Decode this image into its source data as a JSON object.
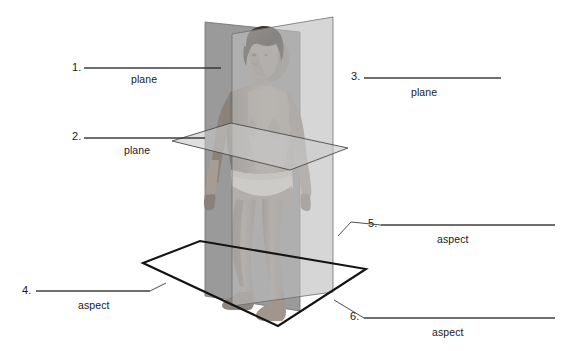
{
  "figure": {
    "background_color": "#ffffff",
    "ink_color": "#1a1a1a"
  },
  "colors": {
    "coronal_plane_fill": "#9a9a9a",
    "sagittal_plane_fill": "#bdbdbd",
    "transverse_plane_fill": "#c9c9c9",
    "base_plane_fill": "#ffffff",
    "base_outline": "#151515",
    "plane_outline": "#6a6a6a",
    "leader_line": "#3a3a3a",
    "figure_skin": "#a79e97",
    "figure_skin_shadow": "#8a8078",
    "figure_hair": "#3b342f",
    "figure_garment": "#ece7de"
  },
  "labels": [
    {
      "id": "label-1",
      "number": "1.",
      "word": "plane",
      "number_x": 72,
      "number_y": 61,
      "word_x": 131,
      "word_y": 73,
      "line": {
        "x1": 84,
        "y1": 68,
        "x2": 221,
        "y2": 68
      },
      "target": "coronal-plane",
      "side": "left"
    },
    {
      "id": "label-2",
      "number": "2.",
      "word": "plane",
      "number_x": 72,
      "number_y": 130,
      "word_x": 124,
      "word_y": 144,
      "line": {
        "x1": 84,
        "y1": 138,
        "x2": 205,
        "y2": 138
      },
      "target": "transverse-plane",
      "side": "left"
    },
    {
      "id": "label-3",
      "number": "3.",
      "word": "plane",
      "number_x": 351,
      "number_y": 70,
      "word_x": 411,
      "word_y": 86,
      "line": {
        "x1": 364,
        "y1": 78,
        "x2": 501,
        "y2": 78
      },
      "target": "sagittal-plane",
      "side": "right"
    },
    {
      "id": "label-4",
      "number": "4.",
      "word": "aspect",
      "number_x": 22,
      "number_y": 284,
      "word_x": 78,
      "word_y": 299,
      "line": {
        "x1": 36,
        "y1": 291,
        "x2": 166,
        "y2": 291
      },
      "target": "base-plane-left",
      "side": "left"
    },
    {
      "id": "label-5",
      "number": "5.",
      "word": "aspect",
      "number_x": 368,
      "number_y": 217,
      "word_x": 437,
      "word_y": 233,
      "line": {
        "x1": 381,
        "y1": 225,
        "x2": 555,
        "y2": 225
      },
      "target": "base-plane-right",
      "side": "right"
    },
    {
      "id": "label-6",
      "number": "6.",
      "word": "aspect",
      "number_x": 350,
      "number_y": 310,
      "word_x": 432,
      "word_y": 326,
      "line": {
        "x1": 364,
        "y1": 318,
        "x2": 555,
        "y2": 318
      },
      "target": "base-plane-front",
      "side": "right"
    }
  ],
  "geometry": {
    "coronal_plane_points": "205,22 205,296 300,311 300,32",
    "sagittal_plane_points": "232,34 232,306 333,292 333,17",
    "transverse_plane_points": "172,141 231,123 348,148 290,170",
    "base_plane_points": "143,263 200,241 366,269 278,326"
  }
}
